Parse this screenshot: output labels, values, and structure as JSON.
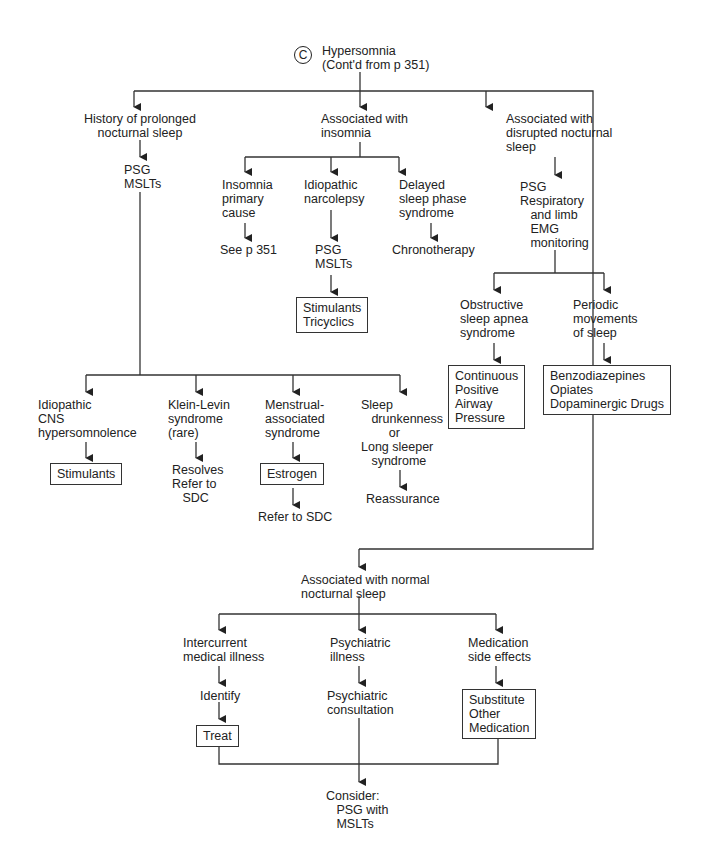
{
  "diagram": {
    "type": "clinical-flowchart",
    "section_marker": "C",
    "root": {
      "title": "Hypersomnia",
      "subtitle": "(Cont'd from p 351)"
    },
    "branches": {
      "prolonged": {
        "label": "History of prolonged\nnocturnal sleep",
        "test": "PSG\nMSLTs",
        "children": [
          {
            "label": "Idiopathic\nCNS\nhypersomnolence",
            "next": "Stimulants",
            "next_boxed": true
          },
          {
            "label": "Klein-Levin\nsyndrome\n(rare)",
            "next": "Resolves\nRefer to\n   SDC",
            "next_boxed": false
          },
          {
            "label": "Menstrual-\nassociated\nsyndrome",
            "next": "Estrogen",
            "next_boxed": true,
            "then": "Refer to SDC"
          },
          {
            "label": "Sleep\n   drunkenness\n        or\nLong sleeper\n   syndrome",
            "next": "Reassurance",
            "next_boxed": false
          }
        ]
      },
      "insomnia": {
        "label": "Associated with\ninsomnia",
        "children": [
          {
            "label": "Insomnia\nprimary\ncause",
            "next": "See p 351"
          },
          {
            "label": "Idiopathic\nnarcolepsy",
            "next": "PSG\nMSLTs",
            "then": "Stimulants\nTricyclics",
            "then_boxed": true
          },
          {
            "label": "Delayed\nsleep phase\nsyndrome",
            "next": "Chronotherapy"
          }
        ]
      },
      "disrupted": {
        "label": "Associated with\ndisrupted nocturnal\nsleep",
        "test": "PSG\nRespiratory\n   and limb\n   EMG\n   monitoring",
        "children": [
          {
            "label": "Obstructive\nsleep apnea\nsyndrome",
            "next": "Continuous\nPositive\nAirway\nPressure",
            "next_boxed": true
          },
          {
            "label": "Periodic\nmovements\nof sleep",
            "next": "Benzodiazepines\nOpiates\nDopaminergic Drugs",
            "next_boxed": true
          }
        ]
      },
      "normal": {
        "label": "Associated with normal\nnocturnal sleep",
        "children": [
          {
            "label": "Intercurrent\nmedical illness",
            "next": "Identify",
            "then": "Treat",
            "then_boxed": true
          },
          {
            "label": "Psychiatric\nillness",
            "next": "Psychiatric\nconsultation"
          },
          {
            "label": "Medication\nside effects",
            "next": "Substitute\nOther\nMedication",
            "next_boxed": true
          }
        ],
        "final": "Consider:\n   PSG with\n   MSLTs"
      }
    }
  }
}
